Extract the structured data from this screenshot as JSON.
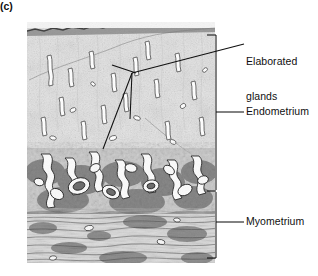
{
  "figure": {
    "panel_letter": "(c)",
    "colors": {
      "ink": "#101010",
      "tissue_light": "#e6e6e6",
      "tissue_mid": "#9a9a9a",
      "tissue_dark": "#3a3a3a",
      "background": "#ffffff"
    }
  },
  "labels": [
    {
      "id": "elaborated-glands",
      "line1": "Elaborated",
      "line2": "glands"
    },
    {
      "id": "endometrium",
      "text": "Endometrium"
    },
    {
      "id": "myometrium",
      "text": "Myometrium"
    }
  ],
  "annotations": {
    "bracket": {
      "x": 216,
      "top": 35,
      "divider": 190,
      "bottom": 258,
      "tick_length": 9
    },
    "leader_lines": [
      {
        "name": "elaborated-glands-leader",
        "from": [
          132,
          73
        ],
        "to": [
          244,
          44
        ]
      },
      {
        "name": "gland-pointer-long",
        "from": [
          132,
          73
        ],
        "to": [
          103,
          149
        ]
      },
      {
        "name": "gland-pointer-short",
        "from": [
          132,
          73
        ],
        "to": [
          130,
          119
        ]
      },
      {
        "name": "endometrium-leader",
        "from": [
          216,
          112
        ],
        "to": [
          244,
          112
        ]
      },
      {
        "name": "myometrium-leader",
        "from": [
          216,
          222
        ],
        "to": [
          244,
          222
        ]
      }
    ]
  }
}
